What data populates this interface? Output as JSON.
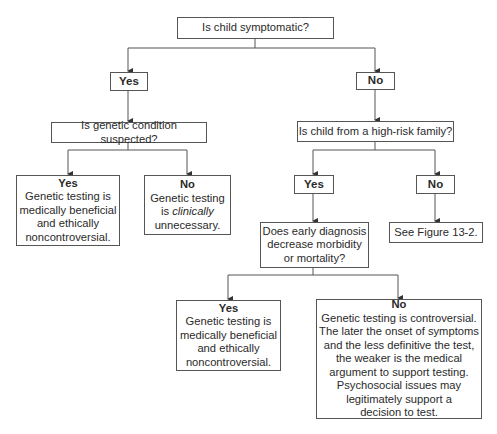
{
  "diagram": {
    "type": "decision-flowchart",
    "root": {
      "text": "Is child symptomatic?"
    },
    "branch_yes": {
      "label": "Yes",
      "question": "Is genetic condition suspected?",
      "outcome_yes": {
        "label": "Yes",
        "lines": [
          "Genetic testing is",
          "medically beneficial",
          "and ethically",
          "noncontroversial."
        ]
      },
      "outcome_no": {
        "label": "No",
        "line1": "Genetic testing",
        "line2_prefix": "is ",
        "line2_italic": "clinically",
        "line3": "unnecessary."
      }
    },
    "branch_no": {
      "label": "No",
      "question": "Is child from a high-risk family?",
      "sub_yes": {
        "label": "Yes",
        "question_lines": [
          "Does early diagnosis",
          "decrease morbidity",
          "or mortality?"
        ],
        "outcome_yes": {
          "label": "Yes",
          "lines": [
            "Genetic testing is",
            "medically beneficial",
            "and ethically",
            "noncontroversial."
          ]
        },
        "outcome_no": {
          "label": "No",
          "lines": [
            "Genetic testing is controversial.",
            "The later the onset of symptoms",
            "and the less definitive the test,",
            "the weaker is the medical",
            "argument to support testing.",
            "Psychosocial issues may",
            "legitimately support a",
            "decision to test."
          ]
        }
      },
      "sub_no": {
        "label": "No",
        "text": "See Figure 13-2."
      }
    }
  }
}
